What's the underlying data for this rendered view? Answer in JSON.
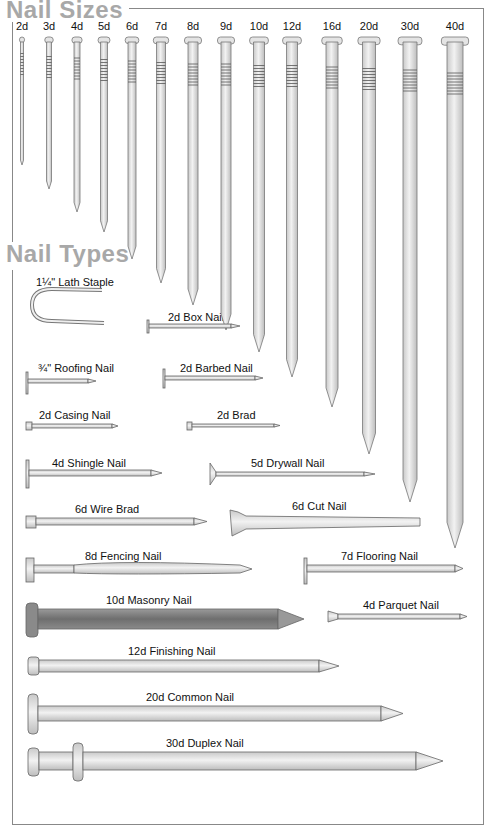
{
  "sizes": {
    "title": "Nail Sizes",
    "items": [
      {
        "label": "2d",
        "x": 22,
        "w": 3,
        "len": 128
      },
      {
        "label": "3d",
        "x": 49,
        "w": 5,
        "len": 152
      },
      {
        "label": "4d",
        "x": 77,
        "w": 6,
        "len": 175
      },
      {
        "label": "5d",
        "x": 104,
        "w": 7,
        "len": 195
      },
      {
        "label": "6d",
        "x": 132,
        "w": 8,
        "len": 222
      },
      {
        "label": "7d",
        "x": 161,
        "w": 9,
        "len": 246
      },
      {
        "label": "8d",
        "x": 193,
        "w": 10,
        "len": 268
      },
      {
        "label": "9d",
        "x": 226,
        "w": 10,
        "len": 293
      },
      {
        "label": "10d",
        "x": 259,
        "w": 11,
        "len": 315
      },
      {
        "label": "12d",
        "x": 292,
        "w": 11,
        "len": 340
      },
      {
        "label": "16d",
        "x": 332,
        "w": 12,
        "len": 370
      },
      {
        "label": "20d",
        "x": 369,
        "w": 13,
        "len": 417
      },
      {
        "label": "30d",
        "x": 410,
        "w": 14,
        "len": 465
      },
      {
        "label": "40d",
        "x": 455,
        "w": 16,
        "len": 511
      }
    ]
  },
  "types": {
    "title": "Nail Types",
    "items": [
      {
        "label": "1¼\" Lath Staple",
        "lx": 36,
        "ly": 276
      },
      {
        "label": "2d Box Nail",
        "lx": 168,
        "ly": 311
      },
      {
        "label": "¾\" Roofing Nail",
        "lx": 38,
        "ly": 362
      },
      {
        "label": "2d Barbed Nail",
        "lx": 180,
        "ly": 362
      },
      {
        "label": "2d Casing Nail",
        "lx": 39,
        "ly": 409
      },
      {
        "label": "2d Brad",
        "lx": 217,
        "ly": 409
      },
      {
        "label": "4d Shingle Nail",
        "lx": 52,
        "ly": 457
      },
      {
        "label": "5d Drywall Nail",
        "lx": 251,
        "ly": 457
      },
      {
        "label": "6d Wire Brad",
        "lx": 75,
        "ly": 503
      },
      {
        "label": "6d Cut Nail",
        "lx": 292,
        "ly": 500
      },
      {
        "label": "8d Fencing Nail",
        "lx": 85,
        "ly": 550
      },
      {
        "label": "7d Flooring Nail",
        "lx": 341,
        "ly": 550
      },
      {
        "label": "10d Masonry Nail",
        "lx": 106,
        "ly": 594
      },
      {
        "label": "4d Parquet Nail",
        "lx": 363,
        "ly": 599
      },
      {
        "label": "12d Finishing Nail",
        "lx": 128,
        "ly": 645
      },
      {
        "label": "20d Common Nail",
        "lx": 146,
        "ly": 691
      },
      {
        "label": "30d Duplex Nail",
        "lx": 166,
        "ly": 737
      }
    ]
  }
}
